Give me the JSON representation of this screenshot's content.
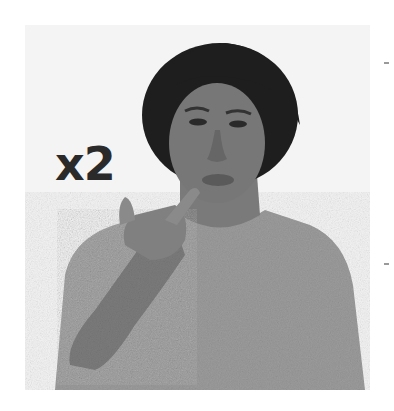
{
  "image": {
    "description": "Grayscale photo of a woman with short curly hair in a knit sweater, touching her chin with two fingers",
    "label": "x2",
    "colors": {
      "background": "#ffffff",
      "photo_background": "#f4f4f4",
      "label": "#2a2a2a",
      "sweater": "#9c9c9c",
      "skin": "#6e6e6e",
      "hair": "#1e1e1e"
    }
  }
}
